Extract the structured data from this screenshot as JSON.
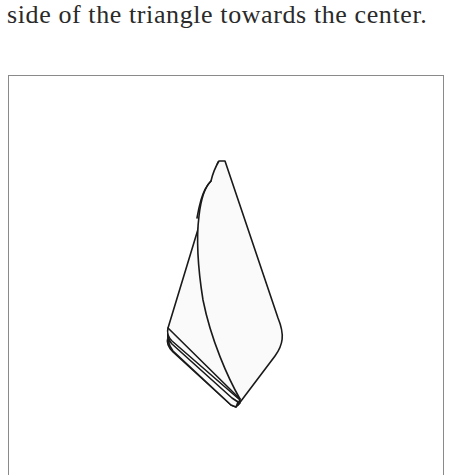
{
  "document": {
    "caption_text": "side of the triangle towards the center."
  },
  "illustration": {
    "description": "Line drawing of a folded napkin/paper forming an elongated kite shape with layered folded edges at the bottom-left",
    "stroke_color": "#1a1a1a",
    "fill_color": "#fafafa",
    "frame_color": "#8a8a8a"
  }
}
